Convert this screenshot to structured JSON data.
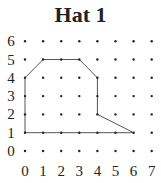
{
  "title": "Hat 1",
  "grid": {
    "x_labels": [
      "0",
      "1",
      "2",
      "3",
      "4",
      "5",
      "6",
      "7"
    ],
    "y_labels": [
      "6",
      "5",
      "4",
      "3",
      "2",
      "1",
      "0"
    ],
    "x_min": 0,
    "x_max": 7,
    "y_min": 0,
    "y_max": 6
  },
  "shape": {
    "name": "hat outline",
    "points": [
      [
        0,
        1
      ],
      [
        0,
        4
      ],
      [
        1,
        5
      ],
      [
        3,
        5
      ],
      [
        4,
        4
      ],
      [
        4,
        2
      ],
      [
        6,
        1
      ],
      [
        0,
        1
      ]
    ]
  },
  "colors": {
    "line": "#555555",
    "dot": "#222222",
    "text": "#222222"
  }
}
